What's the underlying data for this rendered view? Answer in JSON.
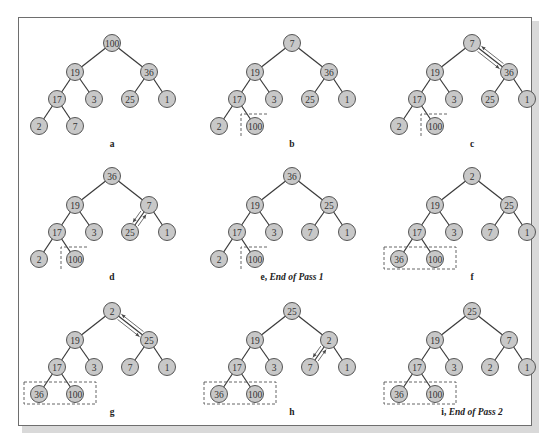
{
  "figure": {
    "panels": [
      {
        "id": "a",
        "label": "a",
        "suffix": "",
        "nodes": [
          "100",
          "19",
          "36",
          "17",
          "3",
          "25",
          "1",
          "2",
          "7"
        ],
        "dashed": "none",
        "arrows": "none"
      },
      {
        "id": "b",
        "label": "b",
        "suffix": "",
        "nodes": [
          "7",
          "19",
          "36",
          "17",
          "3",
          "25",
          "1",
          "2",
          "100"
        ],
        "dashed": "single",
        "arrows": "none"
      },
      {
        "id": "c",
        "label": "c",
        "suffix": "",
        "nodes": [
          "7",
          "19",
          "36",
          "17",
          "3",
          "25",
          "1",
          "2",
          "100"
        ],
        "dashed": "single",
        "arrows": "root-right"
      },
      {
        "id": "d",
        "label": "d",
        "suffix": "",
        "nodes": [
          "36",
          "19",
          "7",
          "17",
          "3",
          "25",
          "1",
          "2",
          "100"
        ],
        "dashed": "single",
        "arrows": "right-leftchild"
      },
      {
        "id": "e",
        "label": "e",
        "suffix": "End of Pass 1",
        "nodes": [
          "36",
          "19",
          "25",
          "17",
          "3",
          "7",
          "1",
          "2",
          "100"
        ],
        "dashed": "single",
        "arrows": "none"
      },
      {
        "id": "f",
        "label": "f",
        "suffix": "",
        "nodes": [
          "2",
          "19",
          "25",
          "17",
          "3",
          "7",
          "1",
          "36",
          "100"
        ],
        "dashed": "double",
        "arrows": "none"
      },
      {
        "id": "g",
        "label": "g",
        "suffix": "",
        "nodes": [
          "2",
          "19",
          "25",
          "17",
          "3",
          "7",
          "1",
          "36",
          "100"
        ],
        "dashed": "double",
        "arrows": "root-right"
      },
      {
        "id": "h",
        "label": "h",
        "suffix": "",
        "nodes": [
          "25",
          "19",
          "2",
          "17",
          "3",
          "7",
          "1",
          "36",
          "100"
        ],
        "dashed": "double",
        "arrows": "right-leftchild"
      },
      {
        "id": "i",
        "label": "i",
        "suffix": "End of Pass 2",
        "nodes": [
          "25",
          "19",
          "7",
          "17",
          "3",
          "2",
          "1",
          "36",
          "100"
        ],
        "dashed": "double",
        "arrows": "none"
      }
    ],
    "colors": {
      "node_fill": "#c8c8c8",
      "node_stroke": "#555555",
      "edge": "#3a3a3a",
      "frame": "#6e6e6e"
    }
  }
}
